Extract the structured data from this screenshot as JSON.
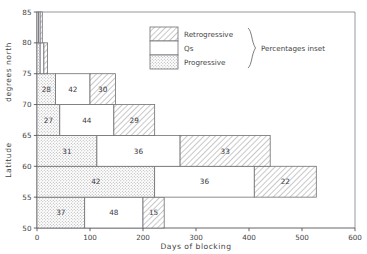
{
  "chart_data": {
    "type": "bar",
    "orientation": "horizontal",
    "title": "",
    "xlabel": "Days of blocking",
    "ylabel": "Latitude",
    "ylabel_secondary": "degrees north",
    "xlim": [
      0,
      600
    ],
    "ylim": [
      50,
      85
    ],
    "xticks": [
      0,
      100,
      200,
      300,
      400,
      500,
      600
    ],
    "yticks": [
      50,
      55,
      60,
      65,
      70,
      75,
      80,
      85
    ],
    "grid": false,
    "legend_position": "inside-top-center",
    "legend_note": "Percentages inset",
    "series": [
      {
        "name": "Progressive",
        "pattern": "stipple"
      },
      {
        "name": "Qs",
        "pattern": "plain"
      },
      {
        "name": "Retrogressive",
        "pattern": "hatch"
      }
    ],
    "bands": [
      {
        "lat_low": 50,
        "lat_high": 55,
        "segments": [
          {
            "series": "Progressive",
            "start": 0,
            "end": 90,
            "label": "37"
          },
          {
            "series": "Qs",
            "start": 90,
            "end": 200,
            "label": "48"
          },
          {
            "series": "Retrogressive",
            "start": 200,
            "end": 240,
            "label": "15"
          }
        ]
      },
      {
        "lat_low": 55,
        "lat_high": 60,
        "segments": [
          {
            "series": "Progressive",
            "start": 0,
            "end": 222,
            "label": "42"
          },
          {
            "series": "Qs",
            "start": 222,
            "end": 410,
            "label": "36"
          },
          {
            "series": "Retrogressive",
            "start": 410,
            "end": 527,
            "label": "22"
          }
        ]
      },
      {
        "lat_low": 60,
        "lat_high": 65,
        "segments": [
          {
            "series": "Progressive",
            "start": 0,
            "end": 113,
            "label": "31"
          },
          {
            "series": "Qs",
            "start": 113,
            "end": 270,
            "label": "36"
          },
          {
            "series": "Retrogressive",
            "start": 270,
            "end": 440,
            "label": "33"
          }
        ]
      },
      {
        "lat_low": 65,
        "lat_high": 70,
        "segments": [
          {
            "series": "Progressive",
            "start": 0,
            "end": 43,
            "label": "27"
          },
          {
            "series": "Qs",
            "start": 43,
            "end": 145,
            "label": "44"
          },
          {
            "series": "Retrogressive",
            "start": 145,
            "end": 222,
            "label": "29"
          }
        ]
      },
      {
        "lat_low": 70,
        "lat_high": 75,
        "segments": [
          {
            "series": "Progressive",
            "start": 0,
            "end": 35,
            "label": "28"
          },
          {
            "series": "Qs",
            "start": 35,
            "end": 100,
            "label": "42"
          },
          {
            "series": "Retrogressive",
            "start": 100,
            "end": 148,
            "label": "30"
          }
        ]
      },
      {
        "lat_low": 75,
        "lat_high": 80,
        "segments": [
          {
            "series": "Progressive",
            "start": 0,
            "end": 6,
            "label": ""
          },
          {
            "series": "Qs",
            "start": 6,
            "end": 13,
            "label": ""
          },
          {
            "series": "Retrogressive",
            "start": 13,
            "end": 20,
            "label": ""
          }
        ]
      },
      {
        "lat_low": 80,
        "lat_high": 85,
        "segments": [
          {
            "series": "Progressive",
            "start": 0,
            "end": 3,
            "label": ""
          },
          {
            "series": "Qs",
            "start": 3,
            "end": 6,
            "label": ""
          },
          {
            "series": "Retrogressive",
            "start": 6,
            "end": 10,
            "label": ""
          }
        ]
      }
    ]
  },
  "axes": {
    "x_title": "Days of blocking",
    "y_title": "Latitude",
    "y_subtitle": "degrees north",
    "x_tick_labels": [
      "0",
      "100",
      "200",
      "300",
      "400",
      "500",
      "600"
    ],
    "y_tick_labels": [
      "50",
      "55",
      "60",
      "65",
      "70",
      "75",
      "80",
      "85"
    ]
  },
  "legend": {
    "items": [
      {
        "label": "Retrogressive",
        "pattern": "hatch"
      },
      {
        "label": "Qs",
        "pattern": "plain"
      },
      {
        "label": "Progressive",
        "pattern": "stipple"
      }
    ],
    "note": "Percentages inset"
  },
  "colors": {
    "ink": "#3f3f44",
    "line": "#6f6f75",
    "hatch": "#9a9aa0",
    "stipple": "#a8a8ae",
    "background": "#ffffff"
  }
}
